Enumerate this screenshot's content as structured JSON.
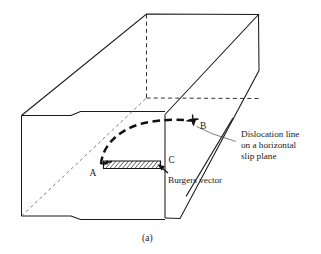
{
  "figure": {
    "caption": "(a)",
    "background_color": "#ffffff",
    "line_color": "#1a1a1a"
  },
  "vertex_labels": {
    "a": "A",
    "b": "B",
    "c": "C"
  },
  "annotations": {
    "dislocation": {
      "line1": "Dislocation line",
      "line2": "on a horizontal",
      "line3": "slip plane"
    },
    "burgers": {
      "label": "Burgers vector"
    }
  },
  "icons": {
    "dislocation_curve": "dashed-arc-icon",
    "burgers_arrow": "arrow-icon",
    "slip_area": "hatched-parallelogram-icon",
    "leader_dislocation": "leader-line-icon",
    "leader_burgers": "leader-line-icon"
  }
}
